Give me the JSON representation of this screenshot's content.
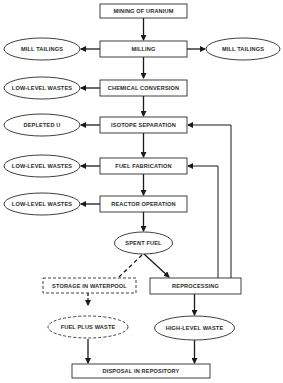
{
  "diagram": {
    "nodes": {
      "mining": {
        "label": "MINING OF URANIUM",
        "shape": "box"
      },
      "milling": {
        "label": "MILLING",
        "shape": "box"
      },
      "mill_tailings_left": {
        "label": "MILL TAILINGS",
        "shape": "ellipse"
      },
      "mill_tailings_right": {
        "label": "MILL TAILINGS",
        "shape": "ellipse"
      },
      "chemical_conversion": {
        "label": "CHEMICAL CONVERSION",
        "shape": "box"
      },
      "low_level_wastes_1": {
        "label": "LOW-LEVEL WASTES",
        "shape": "ellipse"
      },
      "isotope_separation": {
        "label": "ISOTOPE SEPARATION",
        "shape": "box"
      },
      "depleted_u": {
        "label": "DEPLETED U",
        "shape": "ellipse"
      },
      "fuel_fabrication": {
        "label": "FUEL FABRICATION",
        "shape": "box"
      },
      "low_level_wastes_2": {
        "label": "LOW-LEVEL WASTES",
        "shape": "ellipse"
      },
      "reactor_operation": {
        "label": "REACTOR OPERATION",
        "shape": "box"
      },
      "low_level_wastes_3": {
        "label": "LOW-LEVEL WASTES",
        "shape": "ellipse"
      },
      "spent_fuel": {
        "label": "SPENT FUEL",
        "shape": "ellipse"
      },
      "storage_waterpool": {
        "label": "STORAGE IN WATERPOOL",
        "shape": "dashed-box"
      },
      "reprocessing": {
        "label": "REPROCESSING",
        "shape": "box"
      },
      "fuel_plus_waste": {
        "label": "FUEL PLUS WASTE",
        "shape": "dashed-ellipse"
      },
      "high_level_waste": {
        "label": "HIGH-LEVEL WASTE",
        "shape": "ellipse"
      },
      "disposal": {
        "label": "DISPOSAL IN REPOSITORY",
        "shape": "box"
      }
    },
    "edges": [
      {
        "from": "mining",
        "to": "milling",
        "style": "solid"
      },
      {
        "from": "milling",
        "to": "mill_tailings_left",
        "style": "solid"
      },
      {
        "from": "milling",
        "to": "mill_tailings_right",
        "style": "solid"
      },
      {
        "from": "milling",
        "to": "chemical_conversion",
        "style": "solid"
      },
      {
        "from": "chemical_conversion",
        "to": "low_level_wastes_1",
        "style": "solid"
      },
      {
        "from": "chemical_conversion",
        "to": "isotope_separation",
        "style": "solid"
      },
      {
        "from": "isotope_separation",
        "to": "depleted_u",
        "style": "solid"
      },
      {
        "from": "isotope_separation",
        "to": "fuel_fabrication",
        "style": "solid"
      },
      {
        "from": "fuel_fabrication",
        "to": "low_level_wastes_2",
        "style": "solid"
      },
      {
        "from": "fuel_fabrication",
        "to": "reactor_operation",
        "style": "solid"
      },
      {
        "from": "reactor_operation",
        "to": "low_level_wastes_3",
        "style": "solid"
      },
      {
        "from": "reactor_operation",
        "to": "spent_fuel",
        "style": "solid"
      },
      {
        "from": "spent_fuel",
        "to": "reprocessing",
        "style": "solid"
      },
      {
        "from": "spent_fuel",
        "to": "storage_waterpool",
        "style": "dashed"
      },
      {
        "from": "reprocessing",
        "to": "isotope_separation",
        "style": "solid"
      },
      {
        "from": "reprocessing",
        "to": "fuel_fabrication",
        "style": "solid"
      },
      {
        "from": "reprocessing",
        "to": "high_level_waste",
        "style": "solid"
      },
      {
        "from": "storage_waterpool",
        "to": "fuel_plus_waste",
        "style": "dashed"
      },
      {
        "from": "fuel_plus_waste",
        "to": "disposal",
        "style": "solid"
      },
      {
        "from": "high_level_waste",
        "to": "disposal",
        "style": "solid"
      }
    ]
  }
}
